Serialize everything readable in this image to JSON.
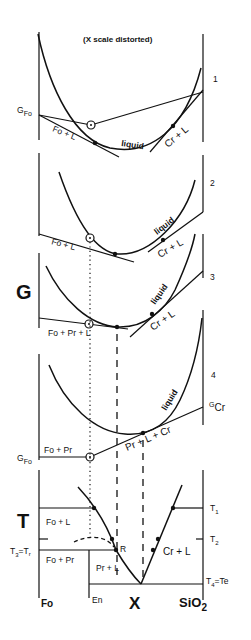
{
  "header": {
    "note": "(X scale distorted)"
  },
  "axes": {
    "g_label": "G",
    "t_label": "T",
    "x_label": "X"
  },
  "panels": [
    {
      "number": "1",
      "left_label_main": "G",
      "left_label_sub": "Fo",
      "labels": {
        "fo_l": "Fo + L",
        "liquid": "liquid",
        "cr_l": "Cr + L"
      }
    },
    {
      "number": "2",
      "labels": {
        "fo_l": "Fo + L",
        "liquid": "liquid",
        "cr_l": "Cr + L"
      }
    },
    {
      "number": "3",
      "labels": {
        "fo_pr_l": "Fo + Pr + L",
        "liquid": "liquid",
        "cr_l": "Cr + L"
      }
    },
    {
      "number": "4",
      "left_label_main": "G",
      "left_label_sub": "Fo",
      "right_label_main": "G",
      "right_label_sub": "Cr",
      "labels": {
        "fo_pr": "Fo + Pr",
        "liquid": "liquid",
        "pr_l_cr": "Pr + L + Cr"
      }
    }
  ],
  "phase_diagram": {
    "left_labels": {
      "t3": "T",
      "t3_sub": "3",
      "eq": "=T",
      "tr_sub": "r"
    },
    "right_labels": {
      "t1": "T",
      "t1_sub": "1",
      "t2": "T",
      "t2_sub": "2",
      "t4": "T",
      "t4_sub": "4",
      "te": "=Te"
    },
    "fields": {
      "fo_l": "Fo + L",
      "fo_pr": "Fo + Pr",
      "pr_l": "Pr + L",
      "cr_l": "Cr + L",
      "r_point": "R"
    },
    "x_axis": {
      "fo": "Fo",
      "en": "En",
      "sio2": "SiO",
      "sio2_sub": "2"
    }
  }
}
